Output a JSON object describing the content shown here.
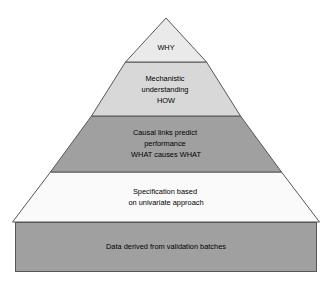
{
  "diagram": {
    "type": "pyramid",
    "orientation": "apex-up",
    "tier_count": 5,
    "background_color": "#ffffff",
    "outline_color": "#55575a",
    "text_color": "#000000",
    "tiers": [
      {
        "id": "tier-why",
        "level": 1,
        "position": "apex",
        "shape": "triangle",
        "fill": "#eaeaea",
        "lines": [
          "WHY"
        ]
      },
      {
        "id": "tier-mechanistic-understanding",
        "level": 2,
        "position": "upper-middle",
        "shape": "trapezoid",
        "fill": "#d8d8d8",
        "lines": [
          "Mechanistic",
          "understanding",
          "HOW"
        ]
      },
      {
        "id": "tier-causal-links",
        "level": 3,
        "position": "middle",
        "shape": "trapezoid",
        "fill": "#a0a0a0",
        "lines": [
          "Causal links predict",
          "performance",
          "WHAT causes WHAT"
        ]
      },
      {
        "id": "tier-specification",
        "level": 4,
        "position": "lower-middle",
        "shape": "trapezoid",
        "fill": "#fafafa",
        "lines": [
          "Specification based",
          "on univariate approach"
        ]
      },
      {
        "id": "tier-data-foundation",
        "level": 5,
        "position": "base",
        "shape": "rectangle",
        "fill": "#a0a0a0",
        "lines": [
          "Data derived from validation batches"
        ]
      }
    ]
  }
}
